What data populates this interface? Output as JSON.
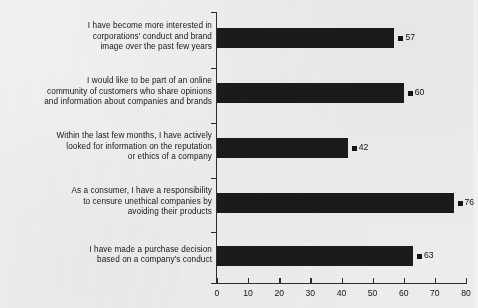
{
  "chart_data": {
    "type": "bar",
    "orientation": "horizontal",
    "title": "",
    "xlabel": "",
    "ylabel": "",
    "xlim": [
      0,
      80
    ],
    "xticks": [
      0,
      10,
      20,
      30,
      40,
      50,
      60,
      70,
      80
    ],
    "grid": false,
    "legend": false,
    "bar_color": "#1b1b1b",
    "background_color": "#f1f0ee",
    "categories": [
      "I have become more interested in corporations' conduct and brand image over the past few years",
      "I would like to be part of an online community of customers who share opinions and information about companies and brands",
      "Within the last few months, I have actively looked for information on the reputation or ethics of a company",
      "As a consumer, I have a responsibility to censure unethical companies by avoiding their products",
      "I have made a purchase decision based on a company's conduct"
    ],
    "category_lines": [
      [
        "I have become more interested in",
        "corporations' conduct and brand",
        "image over the past few years"
      ],
      [
        "I would like to be part of an online",
        "community of customers who share opinions",
        "and information about companies and brands"
      ],
      [
        "Within the last few months, I have actively",
        "looked for information on the reputation",
        "or ethics of a company"
      ],
      [
        "As a consumer, I have a responsibility",
        "to censure unethical companies by",
        "avoiding their products"
      ],
      [
        "I have made a purchase decision",
        "based on a company's conduct"
      ]
    ],
    "values": [
      57,
      60,
      42,
      76,
      63
    ],
    "value_labels": [
      "57",
      "60",
      "42",
      "76",
      "63"
    ]
  }
}
